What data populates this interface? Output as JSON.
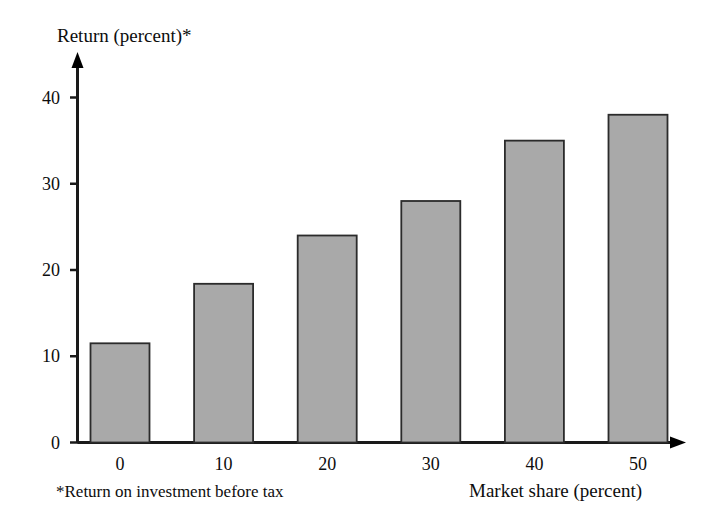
{
  "chart_data": {
    "type": "bar",
    "title": "",
    "ylabel": "Return (percent)*",
    "xlabel": "Market share (percent)",
    "categories": [
      "0",
      "10",
      "20",
      "30",
      "40",
      "50"
    ],
    "values": [
      11.5,
      18.4,
      24,
      28,
      35,
      38
    ],
    "ylim": [
      0,
      44
    ],
    "yticks": [
      0,
      10,
      20,
      30,
      40
    ],
    "ytick_labels": [
      "0",
      "10",
      "20",
      "30",
      "40"
    ],
    "xtick_labels": [
      "0",
      "10",
      "20",
      "30",
      "40",
      "50"
    ],
    "grid": false,
    "legend": false,
    "footnote": "*Return on investment before tax",
    "bar_fill_color": "#a9a9a9",
    "bar_edge_color": "#2b2b2b",
    "axis_color": "#1a1a1a"
  }
}
